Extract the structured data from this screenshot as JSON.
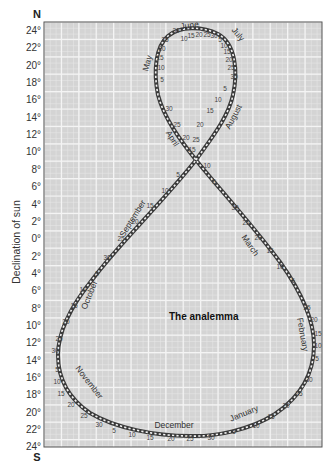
{
  "diagram": {
    "title": "The analemma",
    "y_axis_label": "Declination of sun",
    "north_label": "N",
    "south_label": "S",
    "y_ticks_north": [
      "24°",
      "22°",
      "20°",
      "18°",
      "16°",
      "14°",
      "12°",
      "10°",
      "8°",
      "6°",
      "4°",
      "2°",
      "0°"
    ],
    "y_ticks_south": [
      "2°",
      "4°",
      "6°",
      "8°",
      "10°",
      "12°",
      "14°",
      "16°",
      "18°",
      "20°",
      "22°",
      "24°"
    ],
    "months": [
      {
        "name": "January",
        "x": 245,
        "y": 416,
        "rot": -22
      },
      {
        "name": "February",
        "x": 300,
        "y": 335,
        "rot": 80
      },
      {
        "name": "March",
        "x": 248,
        "y": 247,
        "rot": 55
      },
      {
        "name": "April",
        "x": 170,
        "y": 140,
        "rot": 58
      },
      {
        "name": "May",
        "x": 150,
        "y": 64,
        "rot": -75
      },
      {
        "name": "June",
        "x": 190,
        "y": 28,
        "rot": -8
      },
      {
        "name": "July",
        "x": 236,
        "y": 36,
        "rot": 50
      },
      {
        "name": "August",
        "x": 236,
        "y": 118,
        "rot": -62
      },
      {
        "name": "September",
        "x": 135,
        "y": 220,
        "rot": -58
      },
      {
        "name": "October",
        "x": 92,
        "y": 296,
        "rot": -68
      },
      {
        "name": "November",
        "x": 87,
        "y": 384,
        "rot": 52
      },
      {
        "name": "December",
        "x": 174,
        "y": 428,
        "rot": 0
      }
    ],
    "day_labels": [
      {
        "t": "10",
        "x": 184,
        "y": 41
      },
      {
        "t": "15",
        "x": 191,
        "y": 38
      },
      {
        "t": "20",
        "x": 199,
        "y": 37
      },
      {
        "t": "25",
        "x": 207,
        "y": 37
      },
      {
        "t": "30",
        "x": 214,
        "y": 38
      },
      {
        "t": "5",
        "x": 220,
        "y": 42
      },
      {
        "t": "10",
        "x": 224,
        "y": 48
      },
      {
        "t": "15",
        "x": 227,
        "y": 54
      },
      {
        "t": "20",
        "x": 229,
        "y": 62
      },
      {
        "t": "25",
        "x": 231,
        "y": 70
      },
      {
        "t": "30",
        "x": 234,
        "y": 79
      },
      {
        "t": "5",
        "x": 225,
        "y": 91
      },
      {
        "t": "10",
        "x": 218,
        "y": 102
      },
      {
        "t": "15",
        "x": 210,
        "y": 113
      },
      {
        "t": "20",
        "x": 200,
        "y": 127
      },
      {
        "t": "25",
        "x": 196,
        "y": 142
      },
      {
        "t": "15",
        "x": 192,
        "y": 152
      },
      {
        "t": "30",
        "x": 176,
        "y": 33
      },
      {
        "t": "25",
        "x": 165,
        "y": 42
      },
      {
        "t": "20",
        "x": 162,
        "y": 51
      },
      {
        "t": "15",
        "x": 160,
        "y": 60
      },
      {
        "t": "10",
        "x": 161,
        "y": 70
      },
      {
        "t": "5",
        "x": 162,
        "y": 82
      },
      {
        "t": "30",
        "x": 169,
        "y": 111
      },
      {
        "t": "25",
        "x": 177,
        "y": 127
      },
      {
        "t": "20",
        "x": 186,
        "y": 140
      },
      {
        "t": "10",
        "x": 207,
        "y": 168
      },
      {
        "t": "5",
        "x": 214,
        "y": 184
      },
      {
        "t": "30",
        "x": 235,
        "y": 210
      },
      {
        "t": "25",
        "x": 246,
        "y": 225
      },
      {
        "t": "20",
        "x": 258,
        "y": 240
      },
      {
        "t": "15",
        "x": 270,
        "y": 253
      },
      {
        "t": "10",
        "x": 280,
        "y": 269
      },
      {
        "t": "5",
        "x": 293,
        "y": 283
      },
      {
        "t": "25",
        "x": 307,
        "y": 310
      },
      {
        "t": "20",
        "x": 314,
        "y": 322
      },
      {
        "t": "15",
        "x": 318,
        "y": 336
      },
      {
        "t": "10",
        "x": 318,
        "y": 348
      },
      {
        "t": "5",
        "x": 317,
        "y": 361
      },
      {
        "t": "30",
        "x": 309,
        "y": 382
      },
      {
        "t": "25",
        "x": 299,
        "y": 396
      },
      {
        "t": "20",
        "x": 286,
        "y": 408
      },
      {
        "t": "15",
        "x": 271,
        "y": 419
      },
      {
        "t": "10",
        "x": 256,
        "y": 428
      },
      {
        "t": "5",
        "x": 234,
        "y": 434
      },
      {
        "t": "30",
        "x": 211,
        "y": 440
      },
      {
        "t": "25",
        "x": 190,
        "y": 441
      },
      {
        "t": "20",
        "x": 171,
        "y": 441
      },
      {
        "t": "15",
        "x": 150,
        "y": 440
      },
      {
        "t": "10",
        "x": 132,
        "y": 437
      },
      {
        "t": "5",
        "x": 114,
        "y": 433
      },
      {
        "t": "30",
        "x": 99,
        "y": 427
      },
      {
        "t": "25",
        "x": 84,
        "y": 418
      },
      {
        "t": "20",
        "x": 71,
        "y": 407
      },
      {
        "t": "15",
        "x": 61,
        "y": 396
      },
      {
        "t": "10",
        "x": 57,
        "y": 384
      },
      {
        "t": "5",
        "x": 57,
        "y": 372
      },
      {
        "t": "30",
        "x": 55,
        "y": 353
      },
      {
        "t": "25",
        "x": 59,
        "y": 341
      },
      {
        "t": "20",
        "x": 66,
        "y": 324
      },
      {
        "t": "15",
        "x": 74,
        "y": 308
      },
      {
        "t": "10",
        "x": 83,
        "y": 292
      },
      {
        "t": "5",
        "x": 97,
        "y": 276
      },
      {
        "t": "30",
        "x": 107,
        "y": 260
      },
      {
        "t": "25",
        "x": 121,
        "y": 241
      },
      {
        "t": "20",
        "x": 135,
        "y": 224
      },
      {
        "t": "15",
        "x": 150,
        "y": 208
      },
      {
        "t": "10",
        "x": 165,
        "y": 193
      },
      {
        "t": "5",
        "x": 178,
        "y": 177
      }
    ],
    "colors": {
      "grid_background": "#d4d4d4",
      "grid_line": "#ececec",
      "curve": "#3a3a3a",
      "frame": "#555555"
    }
  }
}
